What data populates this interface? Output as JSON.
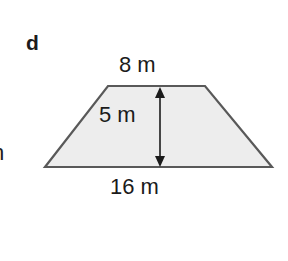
{
  "figure": {
    "part_label": "d",
    "shape_name": "trapezoid",
    "fill_color": "#ededed",
    "stroke_color": "#595959",
    "background_color": "#ffffff",
    "stroke_width": 2.2,
    "vertices": [
      {
        "name": "top-left",
        "x": 108,
        "y": 86
      },
      {
        "name": "top-right",
        "x": 205,
        "y": 86
      },
      {
        "name": "bottom-right",
        "x": 272,
        "y": 167
      },
      {
        "name": "bottom-left",
        "x": 45,
        "y": 167
      }
    ],
    "polygon_points": "108,86 205,86 272,167 45,167"
  },
  "dimensions": {
    "top_side": {
      "label": "8 m",
      "value": 8,
      "unit": "m",
      "position": "above-top-edge"
    },
    "height": {
      "label": "5 m",
      "value": 5,
      "unit": "m",
      "position": "inside-left-of-arrow"
    },
    "bottom_side": {
      "label": "16 m",
      "value": 16,
      "unit": "m",
      "position": "below-bottom-edge"
    }
  },
  "height_arrow": {
    "name": "double-headed-vertical-arrow",
    "x": 160,
    "y_top": 87,
    "y_bottom": 167,
    "color": "#1b1b1b",
    "line_width": 1.6,
    "head_half_width": 5,
    "head_length": 11
  },
  "edge_artifacts": {
    "cropped_neighbor_text": "n"
  }
}
